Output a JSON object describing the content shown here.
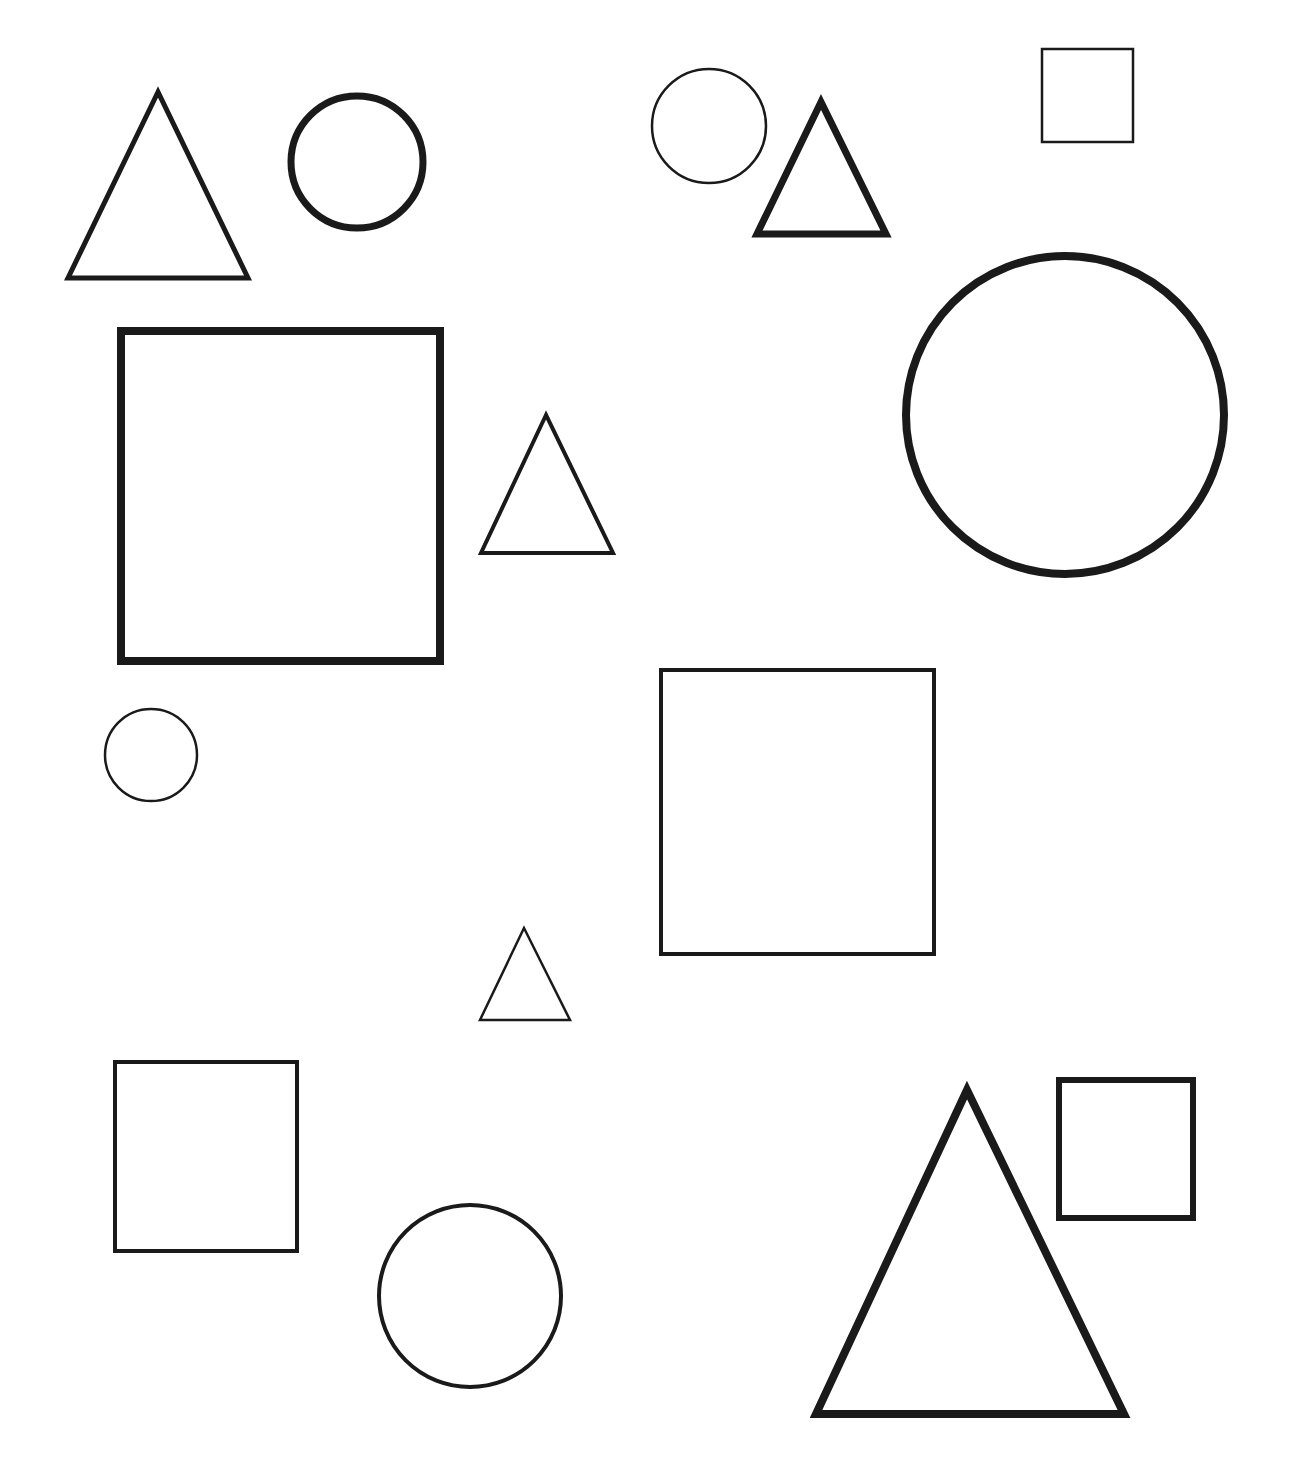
{
  "page": {
    "background": "#ffffff",
    "stroke_color": "#1a1a1a",
    "top_cutoff_text": ""
  },
  "shapes": [
    {
      "id": "triangle-1",
      "type": "triangle",
      "points": "158,92 68,278 248,278",
      "stroke_width": 5
    },
    {
      "id": "circle-1",
      "type": "circle",
      "cx": 357,
      "cy": 162,
      "r": 66,
      "stroke_width": 7
    },
    {
      "id": "circle-2",
      "type": "circle",
      "cx": 709,
      "cy": 126,
      "r": 57,
      "stroke_width": 2.5
    },
    {
      "id": "triangle-2",
      "type": "triangle",
      "points": "821,102 757,234 886,234",
      "stroke_width": 7
    },
    {
      "id": "square-1",
      "type": "rect",
      "x": 1042,
      "y": 49,
      "w": 91,
      "h": 93,
      "stroke_width": 2.5
    },
    {
      "id": "square-2",
      "type": "rect",
      "x": 121,
      "y": 331,
      "w": 319,
      "h": 330,
      "stroke_width": 8
    },
    {
      "id": "triangle-3",
      "type": "triangle",
      "points": "546,415 481,553 613,553",
      "stroke_width": 4
    },
    {
      "id": "circle-3",
      "type": "circle",
      "cx": 1065,
      "cy": 415,
      "r": 159,
      "stroke_width": 8
    },
    {
      "id": "circle-4",
      "type": "circle",
      "cx": 151,
      "cy": 755,
      "r": 46,
      "stroke_width": 2.5
    },
    {
      "id": "square-3",
      "type": "rect",
      "x": 661,
      "y": 670,
      "w": 273,
      "h": 284,
      "stroke_width": 4
    },
    {
      "id": "triangle-4",
      "type": "triangle",
      "points": "524,928 480,1020 570,1020",
      "stroke_width": 2.5
    },
    {
      "id": "square-4",
      "type": "rect",
      "x": 115,
      "y": 1062,
      "w": 182,
      "h": 189,
      "stroke_width": 4
    },
    {
      "id": "circle-5",
      "type": "circle",
      "cx": 470,
      "cy": 1296,
      "r": 91,
      "stroke_width": 4
    },
    {
      "id": "triangle-5",
      "type": "triangle",
      "points": "967,1090 816,1414 1124,1414",
      "stroke_width": 8
    },
    {
      "id": "square-5",
      "type": "rect",
      "x": 1059,
      "y": 1080,
      "w": 134,
      "h": 138,
      "stroke_width": 6
    }
  ]
}
